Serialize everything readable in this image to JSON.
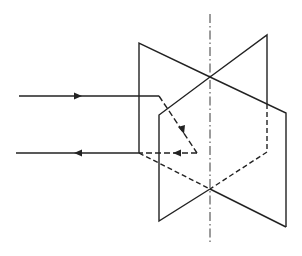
{
  "diagram": {
    "stroke_color": "#222222",
    "background": "#ffffff",
    "axis": {
      "x": 210,
      "y1": 14,
      "y2": 245
    },
    "plane_a": {
      "points": "139,43 286,113 286,227 210,189 139,153"
    },
    "plane_b": {
      "points": "267,35 267,104 210,77 159,115 159,221 210,189 267,152"
    },
    "incident_ray": {
      "x1": 19,
      "y1": 96,
      "x2": 159,
      "y2": 96
    },
    "reflected_ray": {
      "x1": 16,
      "y1": 153,
      "x2": 139,
      "y2": 153
    }
  }
}
